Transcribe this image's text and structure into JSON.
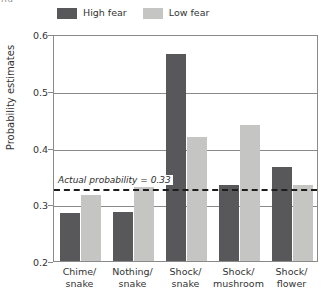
{
  "top_fragment": "nd",
  "legend": {
    "position": "top-center",
    "items": [
      {
        "label": "High fear",
        "color": "#58585a",
        "name": "legend-high-fear"
      },
      {
        "label": "Low fear",
        "color": "#c5c5c3",
        "name": "legend-low-fear"
      }
    ]
  },
  "chart_data": {
    "type": "bar",
    "title": "",
    "xlabel": "",
    "ylabel": "Probability estimates",
    "ylim": [
      0.2,
      0.6
    ],
    "yticks": [
      0.2,
      0.3,
      0.4,
      0.5,
      0.6
    ],
    "ytick_labels": [
      "0.2",
      "0.3",
      "0.4",
      "0.5",
      "0.6"
    ],
    "grid": true,
    "legend_position": "top-center",
    "categories": [
      "Chime/\nsnake",
      "Nothing/\nsnake",
      "Shock/\nsnake",
      "Shock/\nmushroom",
      "Shock/\nflower"
    ],
    "category_lines": [
      [
        "Chime/",
        "snake"
      ],
      [
        "Nothing/",
        "snake"
      ],
      [
        "Shock/",
        "snake"
      ],
      [
        "Shock/",
        "mushroom"
      ],
      [
        "Shock/",
        "flower"
      ]
    ],
    "series": [
      {
        "name": "High fear",
        "color": "#58585a",
        "values": [
          0.284,
          0.286,
          0.565,
          0.334,
          0.365
        ]
      },
      {
        "name": "Low fear",
        "color": "#c5c5c3",
        "values": [
          0.316,
          0.33,
          0.418,
          0.44,
          0.334
        ]
      }
    ],
    "annotations": [
      {
        "type": "hline",
        "text": "Actual probability = 0.33",
        "value": 0.33,
        "style": "dashed",
        "color": "#1d1d1d"
      }
    ]
  },
  "colors": {
    "axis": "#8a8a8a",
    "text": "#333333",
    "reference_line": "#1d1d1d",
    "background": "#ffffff"
  }
}
